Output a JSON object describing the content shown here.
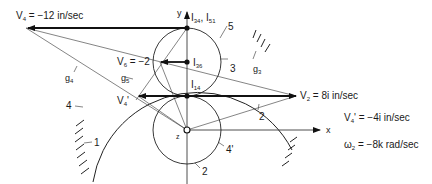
{
  "diagram": {
    "axes": {
      "x_label": "x",
      "y_label": "y",
      "origin_label": "z"
    },
    "links": [
      "1",
      "2",
      "3",
      "4",
      "4'",
      "5"
    ],
    "instant_centers": [
      {
        "id": "I34_I51",
        "label_main": "I",
        "sub1": "34",
        "sep": ", I",
        "sub2": "51"
      },
      {
        "id": "I36",
        "label_main": "I",
        "sub": "36"
      },
      {
        "id": "I14",
        "label_main": "I",
        "sub": "14"
      }
    ],
    "velocities": {
      "V4": {
        "main": "V",
        "sub": "4",
        "text": " = −12 in/sec"
      },
      "V6": {
        "main": "V",
        "sub": "6",
        "text": " = −2"
      },
      "V4p": {
        "main": "V",
        "sub": "4",
        "prime": "'"
      },
      "V2": {
        "main": "V",
        "sub": "2",
        "text": " = 8i in/sec"
      }
    },
    "lines": {
      "g4": {
        "main": "g",
        "sub": "4"
      },
      "g5": {
        "main": "g",
        "sub": "5"
      },
      "g3": {
        "main": "g",
        "sub": "3"
      }
    },
    "given": [
      {
        "main": "V",
        "sub": "4",
        "prime": "'",
        "text": " = −4i in/sec"
      },
      {
        "main": "ω",
        "sub": "2",
        "prime": "",
        "text": " = −8k rad/sec"
      }
    ]
  }
}
